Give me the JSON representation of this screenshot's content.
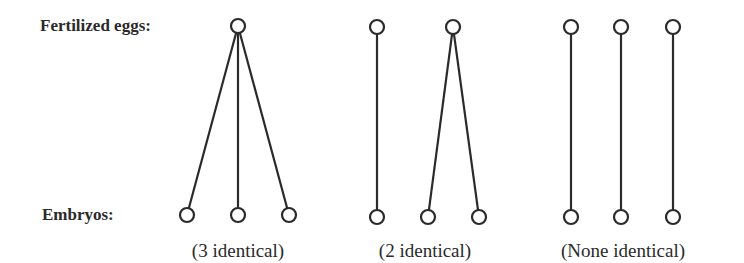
{
  "labels": {
    "eggs": "Fertilized eggs:",
    "embryos": "Embryos:"
  },
  "groups": [
    {
      "caption": "(3 identical)",
      "caption_x": 238,
      "eggs": [
        {
          "x": 238,
          "y": 26
        }
      ],
      "embryos": [
        {
          "x": 187,
          "y": 215
        },
        {
          "x": 238,
          "y": 215
        },
        {
          "x": 289,
          "y": 215
        }
      ],
      "links": [
        [
          0,
          0
        ],
        [
          0,
          1
        ],
        [
          0,
          2
        ]
      ]
    },
    {
      "caption": "(2 identical)",
      "caption_x": 425,
      "eggs": [
        {
          "x": 377,
          "y": 27
        },
        {
          "x": 453,
          "y": 27
        }
      ],
      "embryos": [
        {
          "x": 377,
          "y": 217
        },
        {
          "x": 428,
          "y": 217
        },
        {
          "x": 479,
          "y": 217
        }
      ],
      "links": [
        [
          0,
          0
        ],
        [
          1,
          1
        ],
        [
          1,
          2
        ]
      ]
    },
    {
      "caption": "(None identical)",
      "caption_x": 623,
      "eggs": [
        {
          "x": 571,
          "y": 27
        },
        {
          "x": 621,
          "y": 27
        },
        {
          "x": 673,
          "y": 27
        }
      ],
      "embryos": [
        {
          "x": 571,
          "y": 217
        },
        {
          "x": 621,
          "y": 217
        },
        {
          "x": 673,
          "y": 217
        }
      ],
      "links": [
        [
          0,
          0
        ],
        [
          1,
          1
        ],
        [
          2,
          2
        ]
      ]
    }
  ],
  "style": {
    "stroke": "#2a2a2a",
    "node_radius": 7
  }
}
